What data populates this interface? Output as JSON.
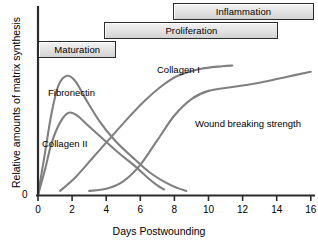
{
  "chart_data": {
    "type": "line",
    "title": "",
    "xlabel": "Days Postwounding",
    "ylabel": "Relative amounts of matrix synthesis",
    "xlim": [
      0,
      16.3
    ],
    "ylim": [
      0,
      1.05
    ],
    "xticks": [
      0,
      2,
      4,
      6,
      8,
      10,
      12,
      14,
      16
    ],
    "xtick_labels": [
      "0",
      "2",
      "4",
      "6",
      "8",
      "10",
      "12",
      "14",
      "16"
    ],
    "yticks": [
      0
    ],
    "ytick_labels": [
      "0"
    ],
    "grid": false,
    "legend": "inline-curve-labels",
    "line_color": "#808080",
    "axis_color": "#2b2b2b",
    "series": [
      {
        "name": "Fibronectin",
        "label": "Fibronectin",
        "points": [
          [
            0,
            0
          ],
          [
            0.4,
            0.3
          ],
          [
            0.8,
            0.6
          ],
          [
            1.2,
            0.8
          ],
          [
            1.7,
            0.87
          ],
          [
            2.2,
            0.83
          ],
          [
            2.8,
            0.7
          ],
          [
            3.6,
            0.54
          ],
          [
            4.5,
            0.4
          ],
          [
            5.5,
            0.28
          ],
          [
            6.5,
            0.17
          ],
          [
            7.5,
            0.09
          ],
          [
            8.2,
            0.05
          ],
          [
            8.7,
            0.03
          ]
        ]
      },
      {
        "name": "Collagen III",
        "label": "Collagen II",
        "points": [
          [
            0,
            0
          ],
          [
            0.4,
            0.18
          ],
          [
            0.8,
            0.38
          ],
          [
            1.3,
            0.53
          ],
          [
            1.8,
            0.6
          ],
          [
            2.3,
            0.58
          ],
          [
            3.0,
            0.5
          ],
          [
            3.8,
            0.41
          ],
          [
            4.7,
            0.31
          ],
          [
            5.6,
            0.22
          ],
          [
            6.4,
            0.13
          ],
          [
            7.0,
            0.07
          ],
          [
            7.4,
            0.04
          ]
        ]
      },
      {
        "name": "Collagen I",
        "label": "Collagen I",
        "points": [
          [
            1.3,
            0.03
          ],
          [
            2.2,
            0.13
          ],
          [
            3.2,
            0.27
          ],
          [
            4.2,
            0.41
          ],
          [
            5.2,
            0.55
          ],
          [
            6.2,
            0.68
          ],
          [
            7.2,
            0.79
          ],
          [
            8.2,
            0.87
          ],
          [
            9.5,
            0.92
          ],
          [
            10.8,
            0.94
          ],
          [
            11.4,
            0.945
          ]
        ]
      },
      {
        "name": "Wound breaking strength",
        "label": "Wound breaking strength",
        "points": [
          [
            3.0,
            0.03
          ],
          [
            4.0,
            0.045
          ],
          [
            5.0,
            0.1
          ],
          [
            6.0,
            0.22
          ],
          [
            7.0,
            0.4
          ],
          [
            8.0,
            0.58
          ],
          [
            9.0,
            0.7
          ],
          [
            10.0,
            0.76
          ],
          [
            11.5,
            0.79
          ],
          [
            13.0,
            0.82
          ],
          [
            14.5,
            0.86
          ],
          [
            16.0,
            0.9
          ]
        ]
      }
    ],
    "phases": [
      {
        "name": "Inflammation",
        "label": "Inflammation",
        "start_day": 0.0,
        "end_day": 4.6,
        "row": 2
      },
      {
        "name": "Proliferation",
        "label": "Proliferation",
        "start_day": 3.9,
        "end_day": 14.1,
        "row": 1
      },
      {
        "name": "Maturation",
        "label": "Maturation",
        "start_day": 7.9,
        "end_day": 16.2,
        "row": 0
      }
    ]
  }
}
